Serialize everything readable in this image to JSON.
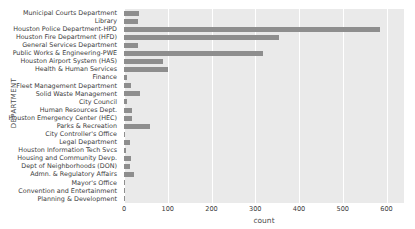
{
  "chart_data": {
    "type": "bar",
    "orientation": "horizontal",
    "title": "",
    "xlabel": "count",
    "ylabel": "DEPARTMENT",
    "xlim": [
      0,
      640
    ],
    "xticks": [
      0,
      100,
      200,
      300,
      400,
      500,
      600
    ],
    "grid": true,
    "legend": null,
    "bar_color": "#8e8e8e",
    "plot_background": "#eaeaea",
    "figure_background": "#ffffff",
    "categories": [
      "Municipal Courts Department",
      "Library",
      "Houston Police Department-HPD",
      "Houston Fire Department (HFD)",
      "General Services Department",
      "Public Works & Engineering-PWE",
      "Houston Airport System (HAS)",
      "Health & Human Services",
      "Finance",
      "Fleet Management Department",
      "Solid Waste Management",
      "City Council",
      "Human Resources Dept.",
      "Houston Emergency Center (HEC)",
      "Parks & Recreation",
      "City Controller's Office",
      "Legal Department",
      "Houston Information Tech Svcs",
      "Housing and Community Devp.",
      "Dept of Neighborhoods (DON)",
      "Admn. & Regulatory Affairs",
      "Mayor's Office",
      "Convention and Entertainment",
      "Planning & Development"
    ],
    "values": [
      34,
      32,
      585,
      355,
      32,
      318,
      90,
      101,
      6,
      15,
      37,
      6,
      19,
      19,
      60,
      3,
      14,
      4,
      17,
      14,
      22,
      3,
      2,
      3
    ]
  }
}
